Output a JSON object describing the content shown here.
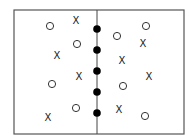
{
  "diagram": {
    "title": "",
    "frame": {
      "x": 14,
      "y": 10,
      "width": 170,
      "height": 124,
      "stroke": "#555555"
    },
    "divider": {
      "x": 97,
      "y1": 10,
      "y2": 134,
      "stroke": "#444444"
    },
    "x_symbol": "X",
    "filled_points": [
      {
        "x": 97,
        "y": 29
      },
      {
        "x": 97,
        "y": 50
      },
      {
        "x": 97,
        "y": 71
      },
      {
        "x": 97,
        "y": 92
      },
      {
        "x": 97,
        "y": 113
      }
    ],
    "open_circles": [
      {
        "x": 50,
        "y": 26
      },
      {
        "x": 77,
        "y": 44
      },
      {
        "x": 52,
        "y": 84
      },
      {
        "x": 76,
        "y": 108
      },
      {
        "x": 117,
        "y": 36
      },
      {
        "x": 146,
        "y": 26
      },
      {
        "x": 123,
        "y": 86
      },
      {
        "x": 145,
        "y": 116
      }
    ],
    "x_marks": [
      {
        "x": 76,
        "y": 20
      },
      {
        "x": 57,
        "y": 55
      },
      {
        "x": 79,
        "y": 76
      },
      {
        "x": 48,
        "y": 117
      },
      {
        "x": 143,
        "y": 43
      },
      {
        "x": 122,
        "y": 60
      },
      {
        "x": 149,
        "y": 76
      },
      {
        "x": 119,
        "y": 109
      }
    ]
  }
}
